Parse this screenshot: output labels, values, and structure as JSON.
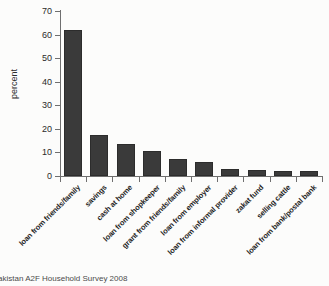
{
  "caption": {
    "text": "akistan A2F Household Survey 2008"
  },
  "chart_data": {
    "type": "bar",
    "categories": [
      "loan from friends/family",
      "savings",
      "cash at home",
      "loan from shopkeeper",
      "grant from friends/family",
      "loan from employer",
      "loan from informal provider",
      "zakat fund",
      "selling cattle",
      "loan from bank/postal bank"
    ],
    "values": [
      62,
      17.5,
      13.5,
      10.5,
      7,
      6,
      3,
      2.5,
      2,
      2
    ],
    "title": "",
    "xlabel": "",
    "ylabel": "percent",
    "ylim": [
      0,
      70
    ],
    "yticks": [
      0,
      10,
      20,
      30,
      40,
      50,
      60,
      70
    ],
    "bar_color": "#3a3a3a",
    "axis_color": "#6f6f6f",
    "grid": false,
    "legend": "none"
  }
}
